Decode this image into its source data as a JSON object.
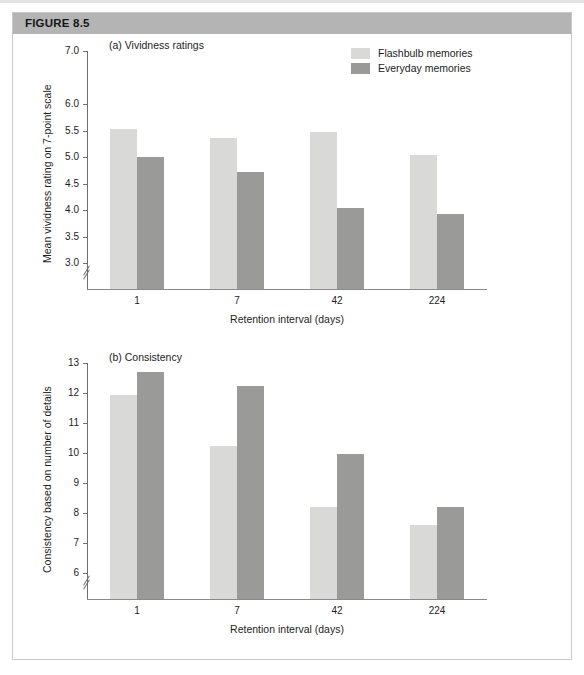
{
  "figure": {
    "banner_label": "FIGURE 8.5"
  },
  "legend": {
    "items": [
      {
        "label": "Flashbulb memories",
        "color": "#d9d9d7"
      },
      {
        "label": "Everyday memories",
        "color": "#9a9b99"
      }
    ]
  },
  "colors": {
    "flashbulb": "#d9d9d7",
    "everyday": "#9a9b99",
    "banner": "#b4b4b4",
    "axis": "#6e6e6e",
    "text": "#1d1d1d"
  },
  "chart_data": [
    {
      "type": "bar",
      "panel": "a",
      "title": "(a) Vividness ratings",
      "xlabel": "Retention interval (days)",
      "ylabel": "Mean vividness rating on 7-point scale",
      "categories": [
        "1",
        "7",
        "42",
        "224"
      ],
      "series": [
        {
          "name": "Flashbulb memories",
          "values": [
            5.52,
            5.36,
            5.47,
            5.04
          ]
        },
        {
          "name": "Everyday memories",
          "values": [
            5.0,
            4.72,
            4.03,
            3.93
          ]
        }
      ],
      "yticks": [
        3.0,
        3.5,
        4.0,
        4.5,
        5.0,
        5.5,
        6.0,
        7.0
      ],
      "ytick_labels": [
        "3.0",
        "3.5",
        "4.0",
        "4.5",
        "5.0",
        "5.5",
        "6.0",
        "7.0"
      ],
      "ylim": [
        3.0,
        7.0
      ],
      "axis_break": true,
      "grid": false,
      "legend_position": "top-right"
    },
    {
      "type": "bar",
      "panel": "b",
      "title": "(b) Consistency",
      "xlabel": "Retention interval (days)",
      "ylabel": "Consistency based on number of details",
      "categories": [
        "1",
        "7",
        "42",
        "224"
      ],
      "series": [
        {
          "name": "Flashbulb memories",
          "values": [
            11.93,
            10.23,
            8.2,
            7.6
          ]
        },
        {
          "name": "Everyday memories",
          "values": [
            12.7,
            12.22,
            9.97,
            8.2
          ]
        }
      ],
      "yticks": [
        6,
        7,
        8,
        9,
        10,
        11,
        12,
        13
      ],
      "ytick_labels": [
        "6",
        "7",
        "8",
        "9",
        "10",
        "11",
        "12",
        "13"
      ],
      "ylim": [
        6,
        13
      ],
      "axis_break": true,
      "grid": false,
      "legend_position": "none"
    }
  ]
}
